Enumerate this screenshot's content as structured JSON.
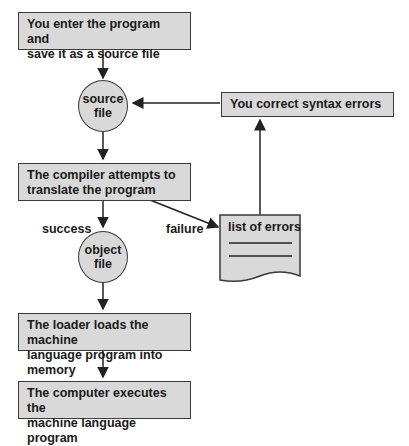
{
  "diagram": {
    "type": "flowchart",
    "nodes": {
      "enter": "You enter the program and\nsave it as a source file",
      "enter_l1": "You enter the program and",
      "enter_l2": "save it as a source file",
      "source_l1": "source",
      "source_l2": "file",
      "correct": "You correct syntax errors",
      "compile_l1": "The compiler attempts to",
      "compile_l2": "translate the program",
      "errors": "list of errors",
      "object_l1": "object",
      "object_l2": "file",
      "load_l1": "The loader loads the machine",
      "load_l2": "language program into memory",
      "exec_l1": "The computer executes the",
      "exec_l2": "machine language program"
    },
    "edge_labels": {
      "success": "success",
      "failure": "failure"
    },
    "colors": {
      "fill": "#d9d9d9",
      "stroke": "#3a3a3a"
    }
  }
}
